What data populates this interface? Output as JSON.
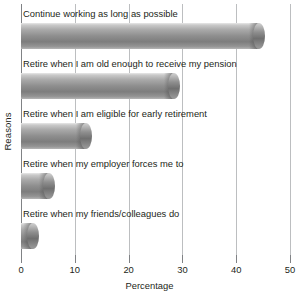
{
  "chart_data": {
    "type": "bar",
    "orientation": "horizontal",
    "title": "",
    "xlabel": "Percentage",
    "ylabel": "Reasons",
    "xlim": [
      0,
      50
    ],
    "xticks": [
      0,
      10,
      20,
      30,
      40,
      50
    ],
    "xtick_labels": [
      "0",
      "10",
      "20",
      "30",
      "40",
      "50"
    ],
    "grid": true,
    "legend": false,
    "categories": [
      "Continue working as long as possible",
      "Retire when I am old enough to receive my pension",
      "Retire when I am eligible for early retirement",
      "Retire when my employer forces me to",
      "Retire when my friends/colleagues do"
    ],
    "values": [
      44.3,
      28.4,
      12.0,
      5.2,
      2.2
    ],
    "bar_color": "#8e8e8e",
    "gridline_color": "#bcbec0",
    "axis_color": "#808285",
    "text_color": "#231f20",
    "background": "#ffffff"
  }
}
